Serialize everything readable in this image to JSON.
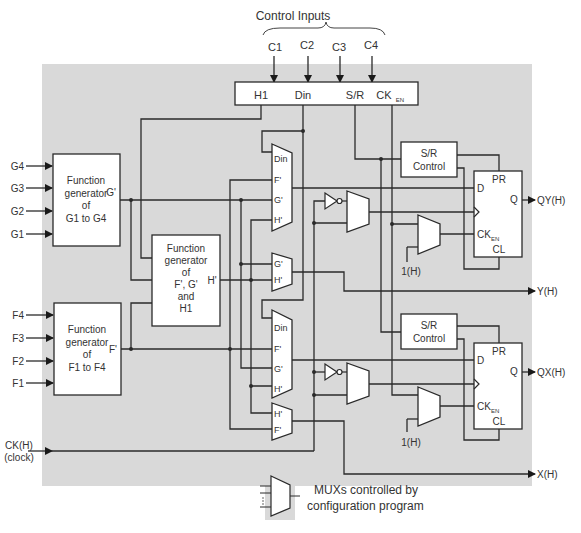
{
  "title": "Control Inputs",
  "control_inputs": [
    "C1",
    "C2",
    "C3",
    "C4"
  ],
  "control_box": {
    "outputs": [
      "H1",
      "Din",
      "S/R",
      "CK",
      "EN"
    ]
  },
  "g_inputs": [
    "G4",
    "G3",
    "G2",
    "G1"
  ],
  "f_inputs": [
    "F4",
    "F3",
    "F2",
    "F1"
  ],
  "func_gen_g": {
    "lines": [
      "Function",
      "generator",
      "of",
      "G1 to G4"
    ],
    "output": "G'"
  },
  "func_gen_f": {
    "lines": [
      "Function",
      "generator",
      "of",
      "F1 to F4"
    ],
    "output": "F'"
  },
  "func_gen_h": {
    "lines": [
      "Function",
      "generator",
      "of",
      "F', G'",
      "and",
      "H1"
    ],
    "output": "H'"
  },
  "mux_labels": {
    "top_din_mux": [
      "Din",
      "F'",
      "G'",
      "H'"
    ],
    "y_mux": [
      "G'",
      "H'"
    ],
    "bottom_din_mux": [
      "Din",
      "F'",
      "G'",
      "H'"
    ],
    "x_mux": [
      "H'",
      "F'"
    ]
  },
  "sr_control": [
    "S/R",
    "Control"
  ],
  "flipflop": {
    "pr": "PR",
    "d": "D",
    "q": "Q",
    "ck": "CK",
    "en": "EN",
    "cl": "CL"
  },
  "const_one": "1(H)",
  "outputs": {
    "qy": "QY(H)",
    "y": "Y(H)",
    "qx": "QX(H)",
    "x": "X(H)"
  },
  "clock_input": [
    "CK(H)",
    "(clock)"
  ],
  "legend": [
    "MUXs controlled by",
    "configuration program"
  ],
  "colors": {
    "background": "#d9d9d9",
    "line": "#2a2a2a",
    "box": "#ffffff"
  }
}
